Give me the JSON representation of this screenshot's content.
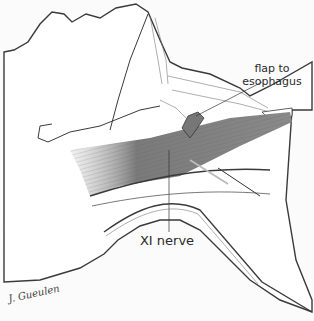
{
  "figure": {
    "type": "medical-illustration",
    "labels": {
      "flap": "flap to\nesophagus",
      "flap_line1": "flap to",
      "flap_line2": "esophagus",
      "nerve": "XI nerve"
    },
    "signature": "J. Gueulen",
    "colors": {
      "background": "#fbfbfb",
      "outline": "#3a3a3a",
      "muscle": "#6a6a6a",
      "text": "#2a2a2a"
    }
  }
}
